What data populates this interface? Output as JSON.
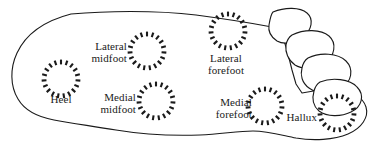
{
  "figure": {
    "stroke_color": "#1a1a1a",
    "background_color": "#ffffff",
    "dash_color": "#1a1a1a"
  },
  "regions": [
    {
      "id": "heel",
      "label": "Heel",
      "label_lines": [
        "Heel"
      ],
      "circle": {
        "cx": 61,
        "cy": 79,
        "r": 17
      },
      "label_pos": {
        "x": 38,
        "y": 94,
        "width": 46,
        "align": "center"
      }
    },
    {
      "id": "lateral-midfoot",
      "label": "Lateral midfoot",
      "label_lines": [
        "Lateral",
        "midfoot"
      ],
      "circle": {
        "cx": 147,
        "cy": 51,
        "r": 17
      },
      "label_pos": {
        "x": 79,
        "y": 41,
        "width": 48,
        "align": "right"
      }
    },
    {
      "id": "medial-midfoot",
      "label": "Medial midfoot",
      "label_lines": [
        "Medial",
        "midfoot"
      ],
      "circle": {
        "cx": 156,
        "cy": 101,
        "r": 17
      },
      "label_pos": {
        "x": 88,
        "y": 92,
        "width": 48,
        "align": "right"
      }
    },
    {
      "id": "lateral-forefoot",
      "label": "Lateral forefoot",
      "label_lines": [
        "Lateral",
        "forefoot"
      ],
      "circle": {
        "cx": 228,
        "cy": 31,
        "r": 17
      },
      "label_pos": {
        "x": 199,
        "y": 53,
        "width": 54,
        "align": "center"
      }
    },
    {
      "id": "medial-forefoot",
      "label": "Medial forefoot",
      "label_lines": [
        "Medial",
        "forefoot"
      ],
      "circle": {
        "cx": 265,
        "cy": 106,
        "r": 17
      },
      "label_pos": {
        "x": 200,
        "y": 97,
        "width": 52,
        "align": "right"
      }
    },
    {
      "id": "hallux",
      "label": "Hallux",
      "label_lines": [
        "Hallux"
      ],
      "circle": {
        "cx": 337,
        "cy": 113,
        "r": 17
      },
      "label_pos": {
        "x": 284,
        "y": 112,
        "width": 33,
        "align": "right"
      }
    }
  ],
  "outline": {
    "foot_body": "M 71,14 C 104,11 155,10 196,15 C 226,19 251,23 272,27 L 283,37 L 288,54 L 292,70 L 296,84 L 302,93 C 311,91 325,90 337,91 C 352,92 363,97 366,107 C 369,117 362,128 348,134 C 334,140 313,141 296,138 C 281,135 268,131 253,131 C 238,131 222,134 200,135 C 172,136 140,134 116,130 C 92,126 70,123 54,120 C 38,117 25,111 18,99 C 10,86 10,68 17,53 C 24,38 40,22 71,14 Z",
    "toes": [
      "M 273,12 C 285,7 300,7 307,13 C 314,19 312,30 303,37 C 295,43 284,45 277,41 C 271,37 268,31 269,25 C 270,19 271,14 273,12 Z",
      "M 292,35 C 304,29 321,29 329,36 C 337,43 335,56 325,63 C 316,69 303,70 295,65 C 288,60 285,52 286,45 C 287,40 289,37 292,35 Z",
      "M 308,58 C 320,52 338,53 346,61 C 354,69 352,82 341,88 C 331,94 317,94 309,88 C 302,83 300,75 302,68 C 303,63 305,60 308,58 Z",
      "M 320,82 C 332,77 350,79 357,87 C 365,95 362,107 351,112 C 341,117 327,117 319,111 C 313,106 312,98 314,91 C 315,87 317,84 320,82 Z"
    ]
  }
}
